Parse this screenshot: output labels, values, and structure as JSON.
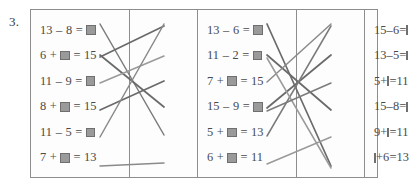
{
  "exercise": {
    "number": "3.",
    "frame_border_color": "#8d8d8d",
    "text_color": "#4a4a4a",
    "answer_box_color": "#9a9a9a"
  },
  "columns": {
    "left": {
      "name": "column-left",
      "align": "left",
      "equations": [
        {
          "id": "L1",
          "text": "13 – 8 = ■",
          "parts": [
            "13",
            "–",
            "8",
            "=",
            "BOX"
          ]
        },
        {
          "id": "L2",
          "text": "6 + ■ = 15",
          "parts": [
            "6",
            "+",
            "BOX",
            "=",
            "15"
          ]
        },
        {
          "id": "L3",
          "text": "11 – 9 = ■",
          "parts": [
            "11",
            "–",
            "9",
            "=",
            "BOX"
          ]
        },
        {
          "id": "L4",
          "text": "8 + ■ = 15",
          "parts": [
            "8",
            "+",
            "BOX",
            "=",
            "15"
          ]
        },
        {
          "id": "L5",
          "text": "11 – 5 = ■",
          "parts": [
            "11",
            "–",
            "5",
            "=",
            "BOX"
          ]
        },
        {
          "id": "L6",
          "text": "7 + ■ = 13",
          "parts": [
            "7",
            "+",
            "BOX",
            "=",
            "13"
          ]
        }
      ]
    },
    "middle": {
      "name": "column-middle",
      "align": "left",
      "equations": [
        {
          "id": "M1",
          "text": "13 – 6 = ■",
          "parts": [
            "13",
            "–",
            "6",
            "=",
            "BOX"
          ]
        },
        {
          "id": "M2",
          "text": "11 – 2 = ■",
          "parts": [
            "11",
            "–",
            "2",
            "=",
            "BOX"
          ]
        },
        {
          "id": "M3",
          "text": "7 + ■ = 15",
          "parts": [
            "7",
            "+",
            "BOX",
            "=",
            "15"
          ]
        },
        {
          "id": "M4",
          "text": "15 – 9 = ■",
          "parts": [
            "15",
            "–",
            "9",
            "=",
            "BOX"
          ]
        },
        {
          "id": "M5",
          "text": "5 + ■ = 13",
          "parts": [
            "5",
            "+",
            "BOX",
            "=",
            "13"
          ]
        },
        {
          "id": "M6",
          "text": "6 + ■ = 11",
          "parts": [
            "6",
            "+",
            "BOX",
            "=",
            "11"
          ]
        }
      ]
    },
    "right": {
      "name": "column-right",
      "align": "left",
      "equations": [
        {
          "id": "R1",
          "text": "15 – 6 = ■",
          "parts": [
            "15",
            "–",
            "6",
            "=",
            "BOX"
          ]
        },
        {
          "id": "R2",
          "text": "13 – 5 = ■",
          "parts": [
            "13",
            "–",
            "5",
            "=",
            "BOX"
          ]
        },
        {
          "id": "R3",
          "text": "5 + ■ = 11",
          "parts": [
            "5",
            "+",
            "BOX",
            "=",
            "11"
          ]
        },
        {
          "id": "R4",
          "text": "15 – 8 = ■",
          "parts": [
            "15",
            "–",
            "8",
            "=",
            "BOX"
          ]
        },
        {
          "id": "R5",
          "text": "9 + ■ = 11",
          "parts": [
            "9",
            "+",
            "BOX",
            "=",
            "11"
          ]
        },
        {
          "id": "R6",
          "text": "■ + 6 = 13",
          "parts": [
            "BOX",
            "+",
            "6",
            "=",
            "13"
          ]
        }
      ]
    }
  },
  "connectors": {
    "left_gap": [
      {
        "from": "L1",
        "to": "M5",
        "x1": 100,
        "y1": 24,
        "x2": 164,
        "y2": 135,
        "color": "#7b7b7b",
        "width": 1.5
      },
      {
        "from": "L2",
        "to": "M4",
        "x1": 100,
        "y1": 55,
        "x2": 164,
        "y2": 107,
        "color": "#6a6a6a",
        "width": 1.7
      },
      {
        "from": "L2",
        "to": "M1",
        "x1": 100,
        "y1": 57,
        "x2": 164,
        "y2": 26,
        "color": "#6a6a6a",
        "width": 1.7
      },
      {
        "from": "L3",
        "to": "M2",
        "x1": 100,
        "y1": 83,
        "x2": 164,
        "y2": 56,
        "color": "#9a9a9a",
        "width": 1.5
      },
      {
        "from": "L4",
        "to": "M3",
        "x1": 100,
        "y1": 110,
        "x2": 164,
        "y2": 81,
        "color": "#6a6a6a",
        "width": 1.7
      },
      {
        "from": "L5",
        "to": "M1",
        "x1": 100,
        "y1": 137,
        "x2": 164,
        "y2": 24,
        "color": "#8a8a8a",
        "width": 1.5
      },
      {
        "from": "L6",
        "to": "M6",
        "x1": 100,
        "y1": 166,
        "x2": 164,
        "y2": 163,
        "color": "#8a8a8a",
        "width": 1.5
      }
    ],
    "right_gap": [
      {
        "from": "M1",
        "to": "R6",
        "x1": 267,
        "y1": 24,
        "x2": 331,
        "y2": 166,
        "color": "#6a6a6a",
        "width": 1.7
      },
      {
        "from": "M2",
        "to": "R4",
        "x1": 267,
        "y1": 55,
        "x2": 331,
        "y2": 110,
        "color": "#6a6a6a",
        "width": 1.7
      },
      {
        "from": "M3",
        "to": "R1",
        "x1": 267,
        "y1": 82,
        "x2": 331,
        "y2": 24,
        "color": "#8a8a8a",
        "width": 1.5
      },
      {
        "from": "M4",
        "to": "R2",
        "x1": 267,
        "y1": 108,
        "x2": 331,
        "y2": 55,
        "color": "#6a6a6a",
        "width": 1.7
      },
      {
        "from": "M5",
        "to": "R1",
        "x1": 267,
        "y1": 136,
        "x2": 331,
        "y2": 26,
        "color": "#7b7b7b",
        "width": 1.5
      },
      {
        "from": "M6",
        "to": "R5",
        "x1": 267,
        "y1": 164,
        "x2": 331,
        "y2": 137,
        "color": "#9a9a9a",
        "width": 1.5
      },
      {
        "from": "M2",
        "to": "R6",
        "x1": 267,
        "y1": 58,
        "x2": 331,
        "y2": 168,
        "color": "#9a9a9a",
        "width": 1.5
      },
      {
        "from": "M4",
        "to": "R3",
        "x1": 267,
        "y1": 111,
        "x2": 331,
        "y2": 83,
        "color": "#7b7b7b",
        "width": 1.5
      }
    ]
  }
}
